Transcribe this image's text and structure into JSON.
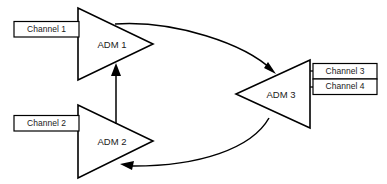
{
  "diagram": {
    "type": "network-topology",
    "background_color": "#ffffff",
    "line_color": "#000000",
    "text_color": "#1a1a1a",
    "nodes": [
      {
        "id": "adm1",
        "label": "ADM 1",
        "shape": "triangle-right",
        "x": 115,
        "y": 44
      },
      {
        "id": "adm2",
        "label": "ADM 2",
        "shape": "triangle-right",
        "x": 115,
        "y": 141
      },
      {
        "id": "adm3",
        "label": "ADM 3",
        "shape": "triangle-left",
        "x": 278,
        "y": 94
      }
    ],
    "channels": [
      {
        "id": "channel1",
        "label": "Channel 1",
        "attached_to": "adm1",
        "side": "left"
      },
      {
        "id": "channel2",
        "label": "Channel 2",
        "attached_to": "adm2",
        "side": "left"
      },
      {
        "id": "channel3",
        "label": "Channel 3",
        "attached_to": "adm3",
        "side": "right"
      },
      {
        "id": "channel4",
        "label": "Channel 4",
        "attached_to": "adm3",
        "side": "right"
      }
    ],
    "connections": [
      {
        "id": "adm1-to-adm3",
        "from": "adm1",
        "to": "adm3",
        "style": "curved",
        "arrow": "end"
      },
      {
        "id": "adm3-to-adm2",
        "from": "adm3",
        "to": "adm2",
        "style": "curved",
        "arrow": "end"
      },
      {
        "id": "adm2-to-adm1",
        "from": "adm2",
        "to": "adm1",
        "style": "straight-vertical",
        "arrow": "end"
      }
    ]
  }
}
